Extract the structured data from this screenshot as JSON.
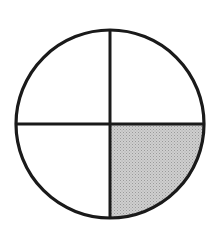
{
  "figure": {
    "parts_total": 4,
    "parts_shaded": 1,
    "shaded_quadrant": "bottom-right",
    "center": [
      110,
      124
    ],
    "radius": 94,
    "stroke_width": 3,
    "colors": {
      "background": "#ffffff",
      "stroke": "#1a1a1a",
      "shade": "#c9c9c9",
      "shade_dot": "#9a9a9a"
    }
  }
}
